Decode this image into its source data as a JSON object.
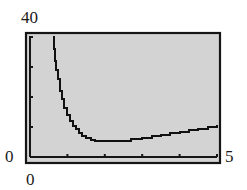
{
  "chart_data": {
    "type": "line",
    "title": "",
    "xlabel": "",
    "ylabel": "",
    "xlim": [
      0,
      5
    ],
    "ylim": [
      0,
      40
    ],
    "grid": false,
    "legend": null,
    "tick_labels": {
      "y_max": "40",
      "y_min": "0",
      "x_min": "0",
      "x_max": "5"
    },
    "x_ticks": [
      1,
      2,
      3,
      4,
      5
    ],
    "y_ticks": [
      10,
      20,
      30
    ],
    "series": [
      {
        "name": "curve",
        "x": [
          0.61,
          0.63,
          0.66,
          0.7,
          0.75,
          0.8,
          0.85,
          0.92,
          1.0,
          1.08,
          1.15,
          1.22,
          1.3,
          1.4,
          1.5,
          1.62,
          1.75,
          1.9,
          2.1,
          2.4,
          2.7,
          3.0,
          3.25,
          3.5,
          3.75,
          4.0,
          4.25,
          4.5,
          4.75,
          5.0
        ],
        "y": [
          40,
          36,
          32,
          29,
          26,
          22,
          19.5,
          16.5,
          14,
          12,
          10.4,
          9.2,
          8.1,
          7.1,
          6.4,
          5.8,
          5.4,
          5.3,
          5.3,
          5.3,
          5.9,
          6.5,
          6.9,
          7.4,
          7.9,
          8.5,
          9.0,
          9.5,
          10.0,
          10.7
        ]
      }
    ]
  },
  "colors": {
    "screen_bg": "#d3d3d3",
    "frame": "#151515",
    "curve": "#111111",
    "text": "#1a1a1a"
  }
}
